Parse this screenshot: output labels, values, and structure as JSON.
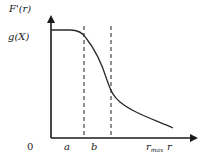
{
  "diagram": {
    "y_axis_label": "F'(r)",
    "y_level_label": "g(X)",
    "origin_label": "0",
    "x_tick_labels": {
      "a": "a",
      "b": "b",
      "r_max_base": "r",
      "r_max_sub": "max"
    },
    "x_axis_label": "r",
    "colors": {
      "axis": "#1a1a1a",
      "curve": "#2a2a2a",
      "dashed": "#333333",
      "text": "#222222",
      "background": "#ffffff"
    }
  }
}
